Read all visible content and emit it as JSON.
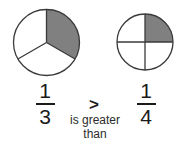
{
  "meta": {
    "background_color": "#ffffff",
    "stroke_color": "#3a3a3a",
    "shade_color": "#808080",
    "text_color": "#1a1a1a"
  },
  "left_model": {
    "label": "one-third-circle",
    "total_parts": 3,
    "shaded_parts": 1,
    "shaded_sector_index": 0,
    "fill_color": "#808080",
    "outline_color": "#3a3a3a"
  },
  "right_model": {
    "label": "one-fourth-circle",
    "total_parts": 4,
    "shaded_parts": 1,
    "shaded_sector_index": 0,
    "fill_color": "#808080",
    "outline_color": "#3a3a3a"
  },
  "left_fraction": {
    "numerator": "1",
    "denominator": "3"
  },
  "right_fraction": {
    "numerator": "1",
    "denominator": "4"
  },
  "comparison": {
    "symbol": ">",
    "words_line1": "is greater",
    "words_line2": "than"
  }
}
